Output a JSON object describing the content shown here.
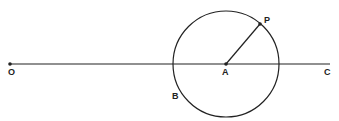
{
  "diagram": {
    "labels": {
      "O": "O",
      "A": "A",
      "P": "P",
      "B": "B",
      "C": "C"
    },
    "line": {
      "x1": 10,
      "y1": 64,
      "x2": 330,
      "y2": 64
    },
    "circle": {
      "cx": 226,
      "cy": 64,
      "r": 53
    },
    "points": {
      "O": [
        10,
        64
      ],
      "A": [
        226,
        64
      ],
      "P": [
        260,
        24
      ]
    },
    "stroke": "#222222"
  }
}
